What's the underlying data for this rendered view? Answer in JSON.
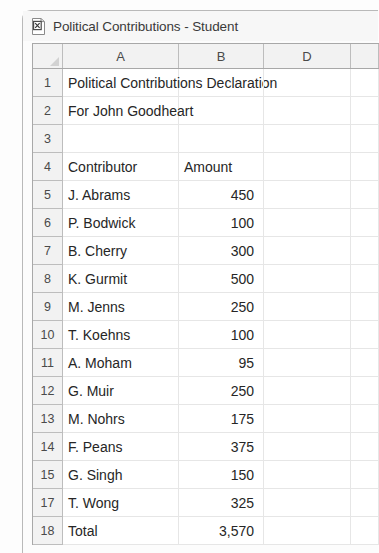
{
  "window": {
    "title": "Political Contributions - Student",
    "icon": "excel-document-icon"
  },
  "sheet": {
    "columns": [
      "A",
      "B",
      "D"
    ],
    "rows": [
      {
        "num": "1",
        "a": "Political Contributions Declaration",
        "b": "",
        "spill": true
      },
      {
        "num": "2",
        "a": "For John Goodheart",
        "b": "",
        "spill": true
      },
      {
        "num": "3",
        "a": "",
        "b": ""
      },
      {
        "num": "4",
        "a": "Contributor",
        "b": "Amount"
      },
      {
        "num": "5",
        "a": "J. Abrams",
        "b": "450"
      },
      {
        "num": "6",
        "a": "P. Bodwick",
        "b": "100"
      },
      {
        "num": "7",
        "a": "B. Cherry",
        "b": "300"
      },
      {
        "num": "8",
        "a": "K. Gurmit",
        "b": "500"
      },
      {
        "num": "9",
        "a": "M. Jenns",
        "b": "250"
      },
      {
        "num": "10",
        "a": "T. Koehns",
        "b": "100"
      },
      {
        "num": "11",
        "a": "A. Moham",
        "b": "95"
      },
      {
        "num": "12",
        "a": "G. Muir",
        "b": "250"
      },
      {
        "num": "13",
        "a": "M. Nohrs",
        "b": "175"
      },
      {
        "num": "14",
        "a": "F. Peans",
        "b": "375"
      },
      {
        "num": "15",
        "a": "G. Singh",
        "b": "150"
      },
      {
        "num": "17",
        "a": "T. Wong",
        "b": "325"
      },
      {
        "num": "18",
        "a": "Total",
        "b": "3,570"
      }
    ]
  },
  "colors": {
    "header_fill": "#f2f2f2",
    "grid_line": "#e6e6e6",
    "border": "#a8a8a8",
    "text": "#262626"
  }
}
